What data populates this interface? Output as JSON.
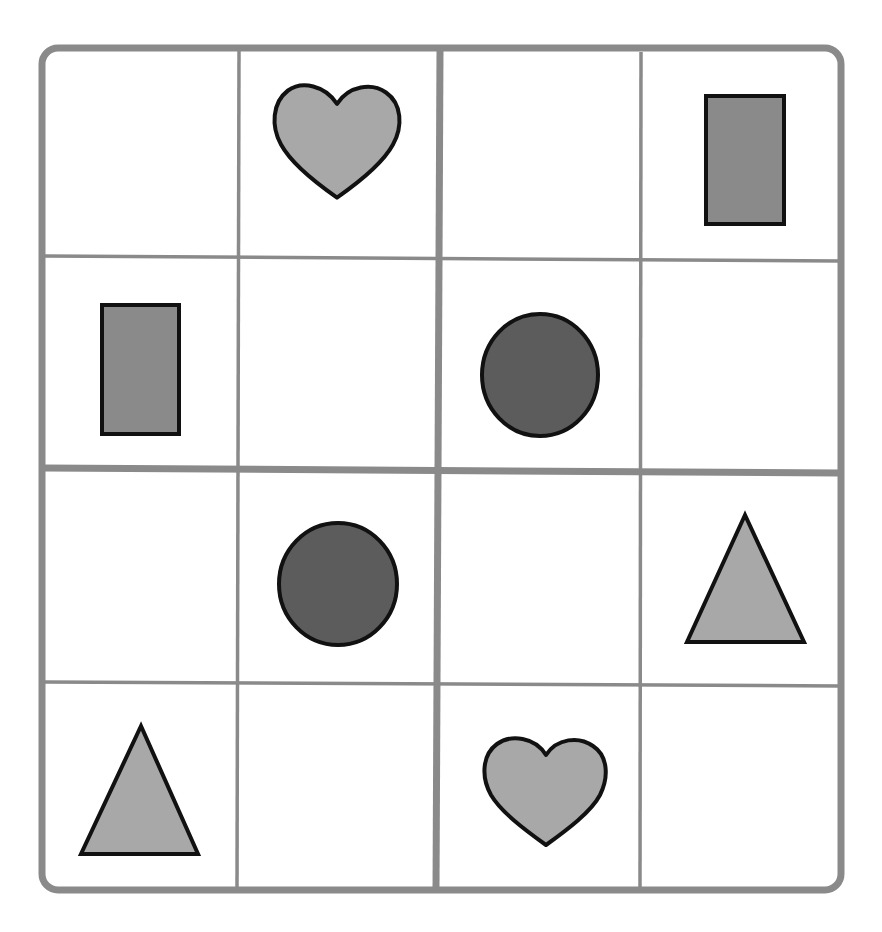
{
  "puzzle": {
    "type": "shape-sudoku-4x4",
    "rows": 4,
    "cols": 4,
    "colors": {
      "grid_line": "#8a8a8a",
      "outline": "#111111",
      "heart_fill": "#a8a8a8",
      "triangle_fill": "#a8a8a8",
      "rectangle_fill": "#8a8a8a",
      "circle_fill": "#5c5c5c",
      "background": "#ffffff"
    },
    "cells": [
      [
        null,
        "heart",
        null,
        "rectangle"
      ],
      [
        "rectangle",
        null,
        "circle",
        null
      ],
      [
        null,
        "circle",
        null,
        "triangle"
      ],
      [
        "triangle",
        null,
        "heart",
        null
      ]
    ]
  }
}
